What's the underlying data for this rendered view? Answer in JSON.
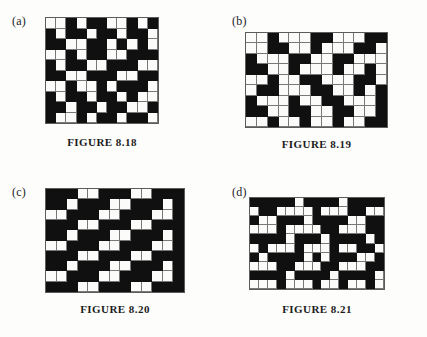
{
  "page": {
    "kind": "textbook-figure-page",
    "background_color": "#fdfdfc",
    "ink_color": "#101010"
  },
  "panels": [
    {
      "id": "a",
      "label": "(a)",
      "caption": "FIGURE 8.18",
      "grid": {
        "columns": 11,
        "rows": 10,
        "black_color": "#101010",
        "white_color": "#fbfbfa",
        "line_color": "#787878",
        "cells": [
          [
            0,
            0,
            1,
            0,
            1,
            1,
            0,
            0,
            1,
            0,
            1
          ],
          [
            1,
            0,
            1,
            1,
            0,
            1,
            1,
            0,
            1,
            1,
            0
          ],
          [
            1,
            1,
            0,
            0,
            1,
            1,
            0,
            1,
            0,
            1,
            0
          ],
          [
            0,
            0,
            1,
            0,
            1,
            1,
            0,
            0,
            1,
            1,
            1
          ],
          [
            1,
            0,
            1,
            1,
            0,
            0,
            1,
            1,
            1,
            0,
            0
          ],
          [
            1,
            1,
            0,
            0,
            1,
            1,
            1,
            0,
            0,
            1,
            1
          ],
          [
            0,
            0,
            1,
            0,
            0,
            1,
            0,
            1,
            1,
            1,
            0
          ],
          [
            1,
            0,
            1,
            1,
            0,
            1,
            1,
            0,
            1,
            0,
            0
          ],
          [
            1,
            1,
            0,
            1,
            1,
            0,
            1,
            1,
            0,
            0,
            1
          ],
          [
            1,
            0,
            0,
            1,
            0,
            1,
            1,
            0,
            1,
            1,
            0
          ]
        ]
      }
    },
    {
      "id": "b",
      "label": "(b)",
      "caption": "FIGURE 8.19",
      "grid": {
        "columns": 13,
        "rows": 9,
        "black_color": "#101010",
        "white_color": "#fbfbfa",
        "line_color": "#787878",
        "cells": [
          [
            0,
            0,
            1,
            0,
            0,
            0,
            1,
            1,
            0,
            0,
            0,
            1,
            1
          ],
          [
            0,
            0,
            1,
            1,
            0,
            0,
            1,
            0,
            0,
            0,
            1,
            1,
            0
          ],
          [
            1,
            0,
            0,
            0,
            1,
            1,
            0,
            0,
            1,
            1,
            0,
            0,
            0
          ],
          [
            1,
            1,
            0,
            0,
            1,
            0,
            0,
            0,
            1,
            0,
            0,
            1,
            0
          ],
          [
            0,
            0,
            1,
            0,
            0,
            1,
            1,
            0,
            0,
            0,
            1,
            1,
            0
          ],
          [
            0,
            1,
            1,
            0,
            0,
            0,
            1,
            1,
            0,
            0,
            1,
            0,
            1
          ],
          [
            1,
            0,
            0,
            0,
            1,
            0,
            0,
            1,
            1,
            0,
            0,
            0,
            1
          ],
          [
            1,
            1,
            0,
            0,
            1,
            1,
            0,
            0,
            1,
            1,
            0,
            0,
            1
          ],
          [
            0,
            0,
            1,
            0,
            0,
            1,
            0,
            0,
            1,
            0,
            0,
            1,
            1
          ]
        ]
      }
    },
    {
      "id": "c",
      "label": "(c)",
      "caption": "FIGURE 8.20",
      "grid": {
        "columns": 13,
        "rows": 10,
        "black_color": "#101010",
        "white_color": "#fbfbfa",
        "line_color": "#787878",
        "cells": [
          [
            1,
            1,
            1,
            0,
            0,
            1,
            1,
            1,
            0,
            0,
            1,
            1,
            1
          ],
          [
            1,
            1,
            0,
            1,
            1,
            1,
            0,
            0,
            1,
            1,
            1,
            0,
            1
          ],
          [
            0,
            0,
            1,
            1,
            1,
            0,
            0,
            1,
            1,
            1,
            0,
            0,
            1
          ],
          [
            1,
            1,
            1,
            0,
            0,
            1,
            1,
            1,
            0,
            0,
            1,
            1,
            1
          ],
          [
            1,
            1,
            0,
            1,
            1,
            1,
            0,
            0,
            1,
            1,
            1,
            0,
            1
          ],
          [
            0,
            0,
            1,
            1,
            1,
            0,
            0,
            1,
            1,
            1,
            0,
            0,
            1
          ],
          [
            1,
            1,
            1,
            0,
            0,
            1,
            1,
            1,
            0,
            0,
            1,
            1,
            1
          ],
          [
            1,
            1,
            0,
            1,
            1,
            1,
            0,
            0,
            1,
            1,
            1,
            0,
            1
          ],
          [
            0,
            0,
            1,
            1,
            1,
            0,
            0,
            1,
            1,
            1,
            0,
            0,
            1
          ],
          [
            1,
            1,
            1,
            0,
            0,
            1,
            1,
            1,
            0,
            0,
            1,
            1,
            1
          ]
        ]
      }
    },
    {
      "id": "d",
      "label": "(d)",
      "caption": "FIGURE 8.21",
      "grid": {
        "columns": 15,
        "rows": 10,
        "black_color": "#101010",
        "white_color": "#fbfbfa",
        "line_color": "#787878",
        "cells": [
          [
            1,
            1,
            1,
            1,
            1,
            0,
            1,
            1,
            1,
            1,
            0,
            1,
            1,
            1,
            1
          ],
          [
            0,
            1,
            1,
            0,
            0,
            0,
            0,
            1,
            0,
            0,
            0,
            1,
            1,
            0,
            0
          ],
          [
            1,
            0,
            0,
            1,
            1,
            1,
            0,
            1,
            1,
            1,
            1,
            0,
            0,
            1,
            1
          ],
          [
            0,
            0,
            0,
            1,
            0,
            0,
            0,
            0,
            1,
            1,
            0,
            0,
            0,
            1,
            1
          ],
          [
            1,
            1,
            1,
            1,
            0,
            1,
            1,
            1,
            0,
            1,
            1,
            1,
            1,
            0,
            1
          ],
          [
            0,
            1,
            0,
            0,
            0,
            1,
            0,
            0,
            0,
            1,
            0,
            0,
            1,
            1,
            0
          ],
          [
            1,
            0,
            1,
            1,
            1,
            1,
            0,
            1,
            0,
            1,
            1,
            1,
            0,
            0,
            1
          ],
          [
            0,
            0,
            0,
            1,
            1,
            0,
            0,
            0,
            1,
            1,
            0,
            0,
            0,
            1,
            1
          ],
          [
            1,
            1,
            1,
            1,
            0,
            1,
            1,
            1,
            1,
            0,
            1,
            1,
            1,
            1,
            0
          ],
          [
            0,
            0,
            0,
            1,
            0,
            0,
            0,
            1,
            0,
            0,
            1,
            0,
            0,
            1,
            0
          ]
        ]
      }
    }
  ]
}
